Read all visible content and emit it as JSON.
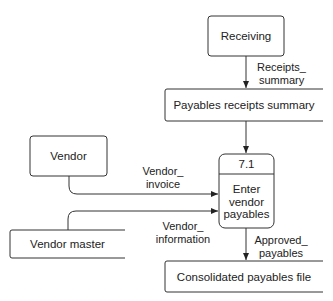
{
  "diagram": {
    "type": "data-flow-diagram",
    "entities": [
      {
        "id": "receiving",
        "label": "Receiving"
      },
      {
        "id": "vendor",
        "label": "Vendor"
      }
    ],
    "data_stores": [
      {
        "id": "payables_receipts_summary",
        "label": "Payables receipts summary"
      },
      {
        "id": "vendor_master",
        "label": "Vendor master"
      },
      {
        "id": "consolidated_payables_file",
        "label": "Consolidated payables file"
      }
    ],
    "process": {
      "number": "7.1",
      "label_lines": [
        "Enter",
        "vendor",
        "payables"
      ]
    },
    "flows": [
      {
        "from": "receiving",
        "to": "payables_receipts_summary",
        "label_lines": [
          "Receipts_",
          "summary"
        ]
      },
      {
        "from": "payables_receipts_summary",
        "to": "process_7_1",
        "label_lines": []
      },
      {
        "from": "vendor",
        "to": "process_7_1",
        "label_lines": [
          "Vendor_",
          "invoice"
        ]
      },
      {
        "from": "vendor_master",
        "to": "process_7_1",
        "label_lines": [
          "Vendor_",
          "information"
        ]
      },
      {
        "from": "process_7_1",
        "to": "consolidated_payables_file",
        "label_lines": [
          "Approved_",
          "payables"
        ]
      }
    ]
  }
}
